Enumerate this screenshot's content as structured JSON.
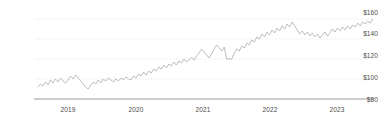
{
  "chart_data": {
    "type": "line",
    "title": "",
    "subtitle": "",
    "xlabel": "",
    "ylabel": "",
    "ylim": [
      80,
      168
    ],
    "xlim": [
      2018.55,
      2023.92
    ],
    "grid": true,
    "grid_style": "dotted-horizontal",
    "legend": false,
    "legend_position": "none",
    "yticks": [
      80,
      100,
      120,
      140,
      160
    ],
    "ytick_labels": [
      "$80",
      "$100",
      "$120",
      "$140",
      "$160"
    ],
    "xticks": [
      2019,
      2020,
      2021,
      2022,
      2023
    ],
    "xtick_labels": [
      "2019",
      "2020",
      "2021",
      "2022",
      "2023"
    ],
    "line_color": "#a8adb3",
    "axis_color": "#9b9b9b",
    "grid_color": "#d9d9d9",
    "tick_text_color": "#4a4a4a",
    "series": [
      {
        "name": "price",
        "x": [
          2018.58,
          2018.62,
          2018.66,
          2018.7,
          2018.74,
          2018.78,
          2018.82,
          2018.86,
          2018.9,
          2018.94,
          2018.98,
          2019.02,
          2019.06,
          2019.1,
          2019.14,
          2019.18,
          2019.22,
          2019.26,
          2019.3,
          2019.34,
          2019.38,
          2019.42,
          2019.46,
          2019.5,
          2019.54,
          2019.58,
          2019.62,
          2019.66,
          2019.7,
          2019.74,
          2019.78,
          2019.82,
          2019.86,
          2019.9,
          2019.94,
          2019.98,
          2020.02,
          2020.06,
          2020.1,
          2020.14,
          2020.18,
          2020.22,
          2020.26,
          2020.3,
          2020.34,
          2020.38,
          2020.42,
          2020.46,
          2020.5,
          2020.54,
          2020.58,
          2020.62,
          2020.66,
          2020.7,
          2020.74,
          2020.78,
          2020.82,
          2020.86,
          2020.9,
          2020.94,
          2020.98,
          2021.02,
          2021.06,
          2021.1,
          2021.14,
          2021.18,
          2021.22,
          2021.26,
          2021.3,
          2021.34,
          2021.38,
          2021.42,
          2021.46,
          2021.5,
          2021.54,
          2021.58,
          2021.62,
          2021.66,
          2021.7,
          2021.74,
          2021.78,
          2021.82,
          2021.86,
          2021.9,
          2021.94,
          2021.98,
          2022.02,
          2022.06,
          2022.1,
          2022.14,
          2022.18,
          2022.22,
          2022.26,
          2022.3,
          2022.34,
          2022.38,
          2022.42,
          2022.46,
          2022.5,
          2022.54,
          2022.58,
          2022.62,
          2022.66,
          2022.7,
          2022.74,
          2022.78,
          2022.82,
          2022.86,
          2022.9,
          2022.94,
          2022.98,
          2023.02,
          2023.06,
          2023.1,
          2023.14,
          2023.18,
          2023.22,
          2023.26,
          2023.3,
          2023.34,
          2023.38,
          2023.42,
          2023.46,
          2023.5,
          2023.54,
          2023.58,
          2023.62,
          2023.66,
          2023.7,
          2023.74,
          2023.78,
          2023.82,
          2023.86,
          2023.9
        ],
        "values": [
          92,
          95,
          93,
          97,
          94,
          99,
          96,
          100,
          97,
          101,
          98,
          96,
          99,
          103,
          100,
          104,
          101,
          98,
          95,
          92,
          90,
          94,
          97,
          95,
          99,
          96,
          100,
          98,
          101,
          99,
          97,
          100,
          98,
          101,
          99,
          102,
          100,
          99,
          103,
          101,
          105,
          103,
          107,
          104,
          108,
          106,
          110,
          108,
          112,
          110,
          114,
          111,
          115,
          113,
          117,
          114,
          118,
          116,
          120,
          117,
          119,
          122,
          119,
          123,
          126,
          130,
          127,
          124,
          121,
          125,
          130,
          134,
          131,
          128,
          132,
          120,
          120,
          120,
          126,
          130,
          128,
          133,
          131,
          136,
          134,
          139,
          137,
          142,
          140,
          145,
          142,
          147,
          144,
          149,
          146,
          151,
          148,
          153,
          150,
          155,
          152,
          157,
          153,
          149,
          145,
          148,
          144,
          147,
          143,
          146,
          142,
          145,
          141,
          144,
          147,
          143,
          146,
          150,
          147,
          151,
          148,
          152,
          149,
          153,
          150,
          154,
          152,
          156,
          153,
          157,
          155,
          158,
          156,
          160
        ]
      }
    ],
    "annotations": [
      {
        "label": "sharp-drop",
        "x": 2022.47,
        "from": 157,
        "to": 120
      },
      {
        "label": "recovery-peak",
        "x": 2023.9,
        "value": 160
      }
    ]
  },
  "axis": {
    "y_labels": [
      "$160",
      "$140",
      "$120",
      "$100",
      "$80"
    ],
    "x_labels": [
      "2019",
      "2020",
      "2021",
      "2022",
      "2023"
    ]
  }
}
